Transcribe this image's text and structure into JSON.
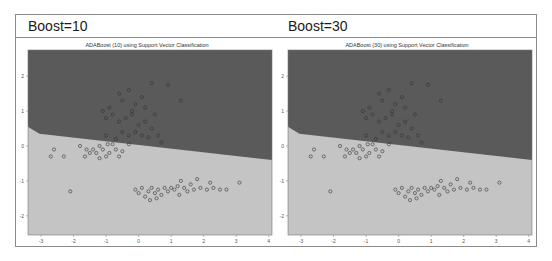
{
  "header": {
    "left_label": "Boost=10",
    "right_label": "Boost=30"
  },
  "colors": {
    "class_upper_region": "#5a5a5a",
    "class_lower_region": "#c4c4c4",
    "point_stroke": "#333333",
    "frame_border": "#8a8a8a"
  },
  "chart_data": [
    {
      "type": "scatter",
      "title": "ADABoost (10) using Support Vector Classification",
      "xlabel": "",
      "ylabel": "",
      "xlim": [
        -3.4,
        4.1
      ],
      "ylim": [
        -2.55,
        2.75
      ],
      "xticks": [
        "-3",
        "-2",
        "-1",
        "0",
        "1",
        "2",
        "3",
        "4"
      ],
      "yticks": [
        "2",
        "1",
        "0",
        "-1",
        "-2"
      ],
      "grid": false,
      "legend": null,
      "decision_boundary": [
        [
          -3.4,
          0.55
        ],
        [
          -3.05,
          0.35
        ],
        [
          4.1,
          -0.4
        ]
      ],
      "regions": [
        {
          "name": "upper-class",
          "color": "#5a5a5a"
        },
        {
          "name": "lower-class",
          "color": "#c4c4c4"
        }
      ],
      "series": [
        {
          "name": "upper-cluster",
          "points": [
            [
              -0.9,
              1.1
            ],
            [
              -0.6,
              1.5
            ],
            [
              -0.5,
              1.3
            ],
            [
              -0.3,
              1.6
            ],
            [
              -0.1,
              1.2
            ],
            [
              0.1,
              1.4
            ],
            [
              0.4,
              1.8
            ],
            [
              0.9,
              1.75
            ],
            [
              1.3,
              1.3
            ],
            [
              -1.1,
              1.0
            ],
            [
              -1.0,
              0.8
            ],
            [
              -0.8,
              0.9
            ],
            [
              -0.6,
              0.7
            ],
            [
              -0.4,
              0.8
            ],
            [
              -0.2,
              0.9
            ],
            [
              0.0,
              0.6
            ],
            [
              0.2,
              0.7
            ],
            [
              0.4,
              0.5
            ],
            [
              0.6,
              0.3
            ],
            [
              -0.5,
              0.4
            ],
            [
              -0.3,
              0.3
            ],
            [
              -0.1,
              0.4
            ],
            [
              0.1,
              0.3
            ],
            [
              0.3,
              0.25
            ],
            [
              0.7,
              0.1
            ],
            [
              -0.7,
              0.2
            ],
            [
              -1.0,
              0.3
            ],
            [
              0.5,
              0.9
            ],
            [
              -0.2,
              1.0
            ],
            [
              0.2,
              1.1
            ]
          ]
        },
        {
          "name": "left-cluster",
          "points": [
            [
              -2.6,
              -0.1
            ],
            [
              -2.7,
              -0.3
            ],
            [
              -2.3,
              -0.3
            ],
            [
              -1.8,
              0.0
            ],
            [
              -1.6,
              -0.1
            ],
            [
              -1.5,
              -0.2
            ],
            [
              -1.4,
              -0.1
            ],
            [
              -1.3,
              -0.2
            ],
            [
              -1.2,
              0.0
            ],
            [
              -1.1,
              -0.1
            ],
            [
              -1.0,
              -0.3
            ],
            [
              -0.9,
              -0.2
            ],
            [
              -0.8,
              0.05
            ],
            [
              -0.7,
              -0.1
            ],
            [
              -0.6,
              -0.3
            ],
            [
              -0.5,
              -0.15
            ],
            [
              -0.3,
              0.05
            ],
            [
              -1.65,
              -0.3
            ],
            [
              -1.2,
              -0.35
            ],
            [
              -0.95,
              0.05
            ],
            [
              -2.1,
              -1.3
            ]
          ]
        },
        {
          "name": "lower-cluster",
          "points": [
            [
              -0.1,
              -1.25
            ],
            [
              0.0,
              -1.35
            ],
            [
              0.1,
              -1.2
            ],
            [
              0.2,
              -1.45
            ],
            [
              0.3,
              -1.3
            ],
            [
              0.4,
              -1.2
            ],
            [
              0.5,
              -1.35
            ],
            [
              0.6,
              -1.25
            ],
            [
              0.7,
              -1.4
            ],
            [
              0.8,
              -1.2
            ],
            [
              0.9,
              -1.3
            ],
            [
              1.0,
              -1.2
            ],
            [
              1.1,
              -1.25
            ],
            [
              1.2,
              -1.15
            ],
            [
              1.3,
              -1.0
            ],
            [
              1.4,
              -1.2
            ],
            [
              1.5,
              -1.3
            ],
            [
              1.6,
              -1.1
            ],
            [
              1.7,
              -1.25
            ],
            [
              1.8,
              -0.95
            ],
            [
              1.9,
              -1.2
            ],
            [
              2.1,
              -1.25
            ],
            [
              2.3,
              -1.2
            ],
            [
              2.5,
              -1.25
            ],
            [
              2.2,
              -1.05
            ],
            [
              2.7,
              -1.25
            ],
            [
              3.1,
              -1.05
            ],
            [
              0.35,
              -1.55
            ],
            [
              0.55,
              -1.5
            ],
            [
              1.25,
              -1.4
            ]
          ]
        }
      ]
    },
    {
      "type": "scatter",
      "title": "ADABoost (30) using Support Vector Classification",
      "xlabel": "",
      "ylabel": "",
      "xlim": [
        -3.4,
        4.1
      ],
      "ylim": [
        -2.55,
        2.75
      ],
      "xticks": [
        "-3",
        "-2",
        "-1",
        "0",
        "1",
        "2",
        "3",
        "4"
      ],
      "yticks": [
        "2",
        "1",
        "0",
        "-1",
        "-2"
      ],
      "grid": false,
      "legend": null,
      "decision_boundary": [
        [
          -3.4,
          0.55
        ],
        [
          -3.05,
          0.35
        ],
        [
          4.1,
          -0.4
        ]
      ],
      "regions": [
        {
          "name": "upper-class",
          "color": "#5a5a5a"
        },
        {
          "name": "lower-class",
          "color": "#c4c4c4"
        }
      ],
      "series": [
        {
          "name": "upper-cluster",
          "points": [
            [
              -0.9,
              1.1
            ],
            [
              -0.6,
              1.5
            ],
            [
              -0.5,
              1.3
            ],
            [
              -0.3,
              1.6
            ],
            [
              -0.1,
              1.2
            ],
            [
              0.1,
              1.4
            ],
            [
              0.4,
              1.8
            ],
            [
              0.9,
              1.75
            ],
            [
              1.3,
              1.3
            ],
            [
              -1.1,
              1.0
            ],
            [
              -1.0,
              0.8
            ],
            [
              -0.8,
              0.9
            ],
            [
              -0.6,
              0.7
            ],
            [
              -0.4,
              0.8
            ],
            [
              -0.2,
              0.9
            ],
            [
              0.0,
              0.6
            ],
            [
              0.2,
              0.7
            ],
            [
              0.4,
              0.5
            ],
            [
              0.6,
              0.3
            ],
            [
              -0.5,
              0.4
            ],
            [
              -0.3,
              0.3
            ],
            [
              -0.1,
              0.4
            ],
            [
              0.1,
              0.3
            ],
            [
              0.3,
              0.25
            ],
            [
              0.7,
              0.1
            ],
            [
              -0.7,
              0.2
            ],
            [
              -1.0,
              0.3
            ],
            [
              0.5,
              0.9
            ],
            [
              -0.2,
              1.0
            ],
            [
              0.2,
              1.1
            ]
          ]
        },
        {
          "name": "left-cluster",
          "points": [
            [
              -2.6,
              -0.1
            ],
            [
              -2.7,
              -0.3
            ],
            [
              -2.3,
              -0.3
            ],
            [
              -1.8,
              0.0
            ],
            [
              -1.6,
              -0.1
            ],
            [
              -1.5,
              -0.2
            ],
            [
              -1.4,
              -0.1
            ],
            [
              -1.3,
              -0.2
            ],
            [
              -1.2,
              0.0
            ],
            [
              -1.1,
              -0.1
            ],
            [
              -1.0,
              -0.3
            ],
            [
              -0.9,
              -0.2
            ],
            [
              -0.8,
              0.05
            ],
            [
              -0.7,
              -0.1
            ],
            [
              -0.6,
              -0.3
            ],
            [
              -0.5,
              -0.15
            ],
            [
              -0.3,
              0.05
            ],
            [
              -1.65,
              -0.3
            ],
            [
              -1.2,
              -0.35
            ],
            [
              -0.95,
              0.05
            ],
            [
              -2.1,
              -1.3
            ]
          ]
        },
        {
          "name": "lower-cluster",
          "points": [
            [
              -0.1,
              -1.25
            ],
            [
              0.0,
              -1.35
            ],
            [
              0.1,
              -1.2
            ],
            [
              0.2,
              -1.45
            ],
            [
              0.3,
              -1.3
            ],
            [
              0.4,
              -1.2
            ],
            [
              0.5,
              -1.35
            ],
            [
              0.6,
              -1.25
            ],
            [
              0.7,
              -1.4
            ],
            [
              0.8,
              -1.2
            ],
            [
              0.9,
              -1.3
            ],
            [
              1.0,
              -1.2
            ],
            [
              1.1,
              -1.25
            ],
            [
              1.2,
              -1.15
            ],
            [
              1.3,
              -1.0
            ],
            [
              1.4,
              -1.2
            ],
            [
              1.5,
              -1.3
            ],
            [
              1.6,
              -1.1
            ],
            [
              1.7,
              -1.25
            ],
            [
              1.8,
              -0.95
            ],
            [
              1.9,
              -1.2
            ],
            [
              2.1,
              -1.25
            ],
            [
              2.3,
              -1.2
            ],
            [
              2.5,
              -1.25
            ],
            [
              2.2,
              -1.05
            ],
            [
              2.7,
              -1.25
            ],
            [
              3.1,
              -1.05
            ],
            [
              0.35,
              -1.55
            ],
            [
              0.55,
              -1.5
            ],
            [
              1.25,
              -1.4
            ]
          ]
        }
      ]
    }
  ]
}
